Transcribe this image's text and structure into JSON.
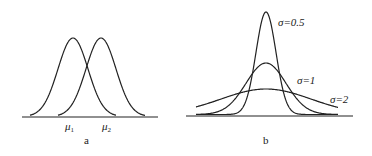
{
  "panels": [
    {
      "id": "a",
      "caption": "a",
      "description": "Two normal curves with equal sigma and different means",
      "labels": {
        "mu1": "μ",
        "mu1_sub": "1",
        "mu2": "μ",
        "mu2_sub": "2"
      }
    },
    {
      "id": "b",
      "caption": "b",
      "description": "Three normal curves with same mean and different sigma",
      "labels": {
        "s05": "σ=0.5",
        "s1": "σ=1",
        "s2": "σ=2"
      }
    }
  ],
  "chart_data": {
    "type": "line",
    "panels": [
      {
        "name": "a",
        "series": [
          {
            "name": "μ1",
            "mean": "μ1",
            "sigma": 1
          },
          {
            "name": "μ2",
            "mean": "μ2",
            "sigma": 1
          }
        ]
      },
      {
        "name": "b",
        "series": [
          {
            "name": "σ=0.5",
            "sigma": 0.5
          },
          {
            "name": "σ=1",
            "sigma": 1
          },
          {
            "name": "σ=2",
            "sigma": 2
          }
        ]
      }
    ]
  }
}
